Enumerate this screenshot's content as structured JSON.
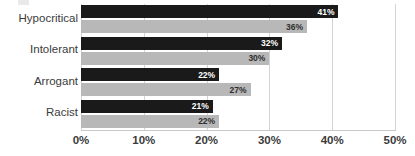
{
  "chart_data": {
    "type": "bar",
    "orientation": "horizontal",
    "title": "",
    "xlabel": "",
    "ylabel": "",
    "categories": [
      "Hypocritical",
      "Intolerant",
      "Arrogant",
      "Racist"
    ],
    "series": [
      {
        "name": "series-dark",
        "color": "#1a1a1a",
        "values": [
          41,
          32,
          22,
          21
        ],
        "labels": [
          "41%",
          "32%",
          "22%",
          "21%"
        ]
      },
      {
        "name": "series-light",
        "color": "#b8b8b8",
        "values": [
          36,
          30,
          27,
          22
        ],
        "labels": [
          "36%",
          "30%",
          "27%",
          "22%"
        ]
      }
    ],
    "xlim": [
      0,
      50
    ],
    "xtick_values": [
      0,
      10,
      20,
      30,
      40,
      50
    ],
    "xtick_labels": [
      "0%",
      "10%",
      "20%",
      "30%",
      "40%",
      "50%"
    ],
    "grid": true,
    "grid_axis": "x",
    "legend": "none",
    "value_label_format": "percent"
  },
  "colors": {
    "background": "#ffffff",
    "dark_series": "#1a1a1a",
    "light_series": "#b8b8b8",
    "gridline": "#d4d4d4",
    "axis": "#c9c9c9",
    "category_text": "#3b3b3b",
    "tick_text": "#3b3b3b",
    "dark_bar_label_text": "#ffffff",
    "light_bar_label_text": "#2e2e2e"
  }
}
